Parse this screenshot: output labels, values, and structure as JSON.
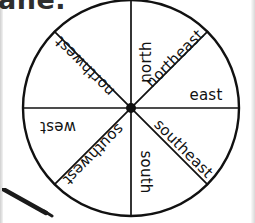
{
  "page": {
    "cut_off_text": "ane.",
    "background_color": "#ffffff",
    "ink_color": "#111111"
  },
  "diagram": {
    "name": "compass-rose",
    "type": "pie-sectors",
    "center": {
      "x": 131,
      "y": 108
    },
    "radius": 108,
    "sector_count": 8,
    "sectors": [
      {
        "id": "north",
        "label": "north",
        "angle_deg": 0,
        "rotation_deg": -90,
        "orientation": "rotated-ccw"
      },
      {
        "id": "northeast",
        "label": "northeast",
        "angle_deg": 45,
        "rotation_deg": -45,
        "orientation": "diagonal-up-right"
      },
      {
        "id": "east",
        "label": "east",
        "angle_deg": 90,
        "rotation_deg": 0,
        "orientation": "upright"
      },
      {
        "id": "southeast",
        "label": "southeast",
        "angle_deg": 135,
        "rotation_deg": 45,
        "orientation": "diagonal-down-right"
      },
      {
        "id": "south",
        "label": "south",
        "angle_deg": 180,
        "rotation_deg": 90,
        "orientation": "rotated-cw"
      },
      {
        "id": "southwest",
        "label": "southwest",
        "angle_deg": 225,
        "rotation_deg": 135,
        "orientation": "upside-down-diagonal"
      },
      {
        "id": "west",
        "label": "west",
        "angle_deg": 270,
        "rotation_deg": 180,
        "orientation": "upside-down"
      },
      {
        "id": "northwest",
        "label": "northwest",
        "angle_deg": 315,
        "rotation_deg": 225,
        "orientation": "upside-down-diagonal"
      }
    ]
  },
  "annotations": {
    "pencil": "pencil-marker"
  }
}
